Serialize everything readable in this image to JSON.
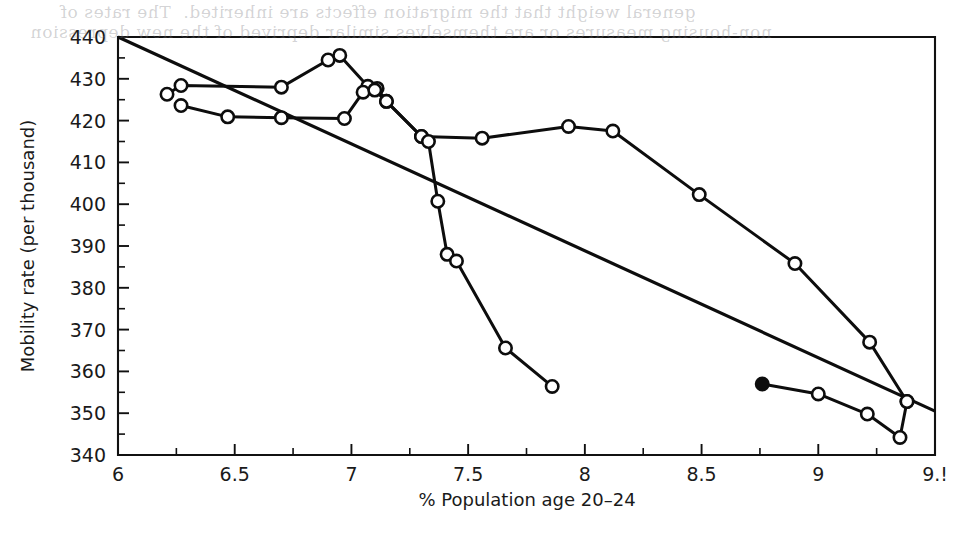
{
  "figure": {
    "background_color": "#ffffff",
    "ink_color": "#0d0d0d",
    "scan_artifact_top": "general weight that the migration effects are inherited.  The rates of",
    "scan_artifact_top2": "non-housing measures or are themselves similar deprived of the new depression"
  },
  "chart_data": {
    "type": "line",
    "title": "",
    "subtitle": "",
    "xlabel": "% Population age 20–24",
    "ylabel": "Mobility rate (per thousand)",
    "xlim": [
      6,
      9.5
    ],
    "ylim": [
      340,
      440
    ],
    "grid": false,
    "legend": "none",
    "x_major_ticks": [
      6,
      6.5,
      7,
      7.5,
      8,
      8.5,
      9,
      9.5
    ],
    "x_tick_labels": [
      "6",
      "6.5",
      "7",
      "7.5",
      "8",
      "8.5",
      "9",
      "9.!"
    ],
    "x_minor_step": 0.25,
    "y_major_ticks": [
      340,
      350,
      360,
      370,
      380,
      390,
      400,
      410,
      420,
      430,
      440
    ],
    "y_tick_labels": [
      "340",
      "350",
      "360",
      "370",
      "380",
      "390",
      "400",
      "410",
      "420",
      "430",
      "440"
    ],
    "y_minor_step": 5,
    "series": [
      {
        "name": "upper-branch",
        "marker": "open-circle",
        "points": [
          [
            6.21,
            426.3
          ],
          [
            6.27,
            428.4
          ],
          [
            6.7,
            428.0
          ],
          [
            6.9,
            434.5
          ],
          [
            6.95,
            435.6
          ],
          [
            7.07,
            428.2
          ],
          [
            7.11,
            427.7
          ],
          [
            7.15,
            424.6
          ],
          [
            7.3,
            416.2
          ],
          [
            7.56,
            415.8
          ],
          [
            7.93,
            418.6
          ],
          [
            8.12,
            417.5
          ],
          [
            8.49,
            402.3
          ],
          [
            8.9,
            385.8
          ],
          [
            9.22,
            367.0
          ],
          [
            9.38,
            352.8
          ]
        ]
      },
      {
        "name": "lower-branch",
        "marker": "open-circle",
        "points": [
          [
            6.27,
            423.6
          ],
          [
            6.47,
            420.9
          ],
          [
            6.7,
            420.7
          ],
          [
            6.97,
            420.5
          ],
          [
            7.05,
            426.8
          ],
          [
            7.1,
            427.3
          ],
          [
            7.15,
            424.6
          ],
          [
            7.3,
            416.2
          ],
          [
            7.33,
            415.0
          ],
          [
            7.37,
            400.7
          ],
          [
            7.41,
            388.0
          ],
          [
            7.45,
            386.4
          ],
          [
            7.66,
            365.6
          ],
          [
            7.86,
            356.4
          ]
        ]
      },
      {
        "name": "lowest-branch",
        "marker": "mixed",
        "points": [
          [
            8.76,
            357.0
          ],
          [
            9.0,
            354.6
          ],
          [
            9.21,
            349.8
          ],
          [
            9.35,
            344.2
          ],
          [
            9.38,
            352.8
          ]
        ],
        "filled_point_index": 0
      }
    ],
    "trend_line": {
      "name": "regression-line",
      "x_start": 6.0,
      "y_start": 440.0,
      "x_end": 9.5,
      "y_end": 350.5
    }
  },
  "axes": {
    "plot_left_px": 118,
    "plot_right_px": 935,
    "plot_top_px": 37,
    "plot_bottom_px": 455
  }
}
